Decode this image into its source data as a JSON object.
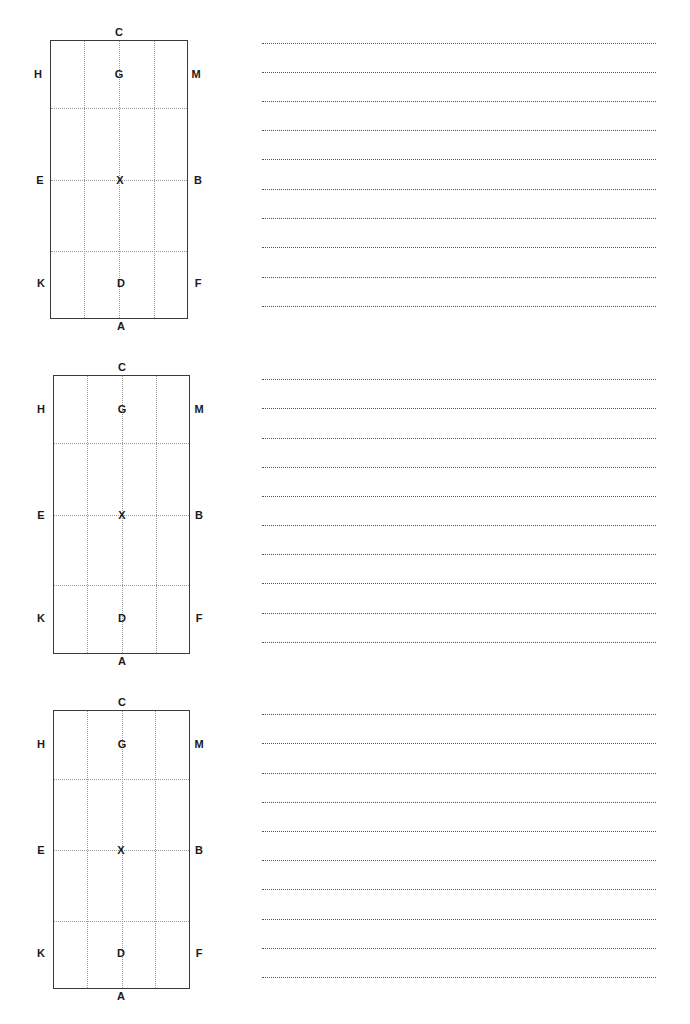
{
  "page": {
    "arenas": [
      {
        "markers": {
          "top": "C",
          "bottom": "A",
          "left_top": "H",
          "left_mid": "E",
          "left_bot": "K",
          "right_top": "M",
          "right_mid": "B",
          "right_bot": "F",
          "center_top": "G",
          "center_mid": "X",
          "center_bot": "D"
        },
        "writing_lines": 10
      },
      {
        "markers": {
          "top": "C",
          "bottom": "A",
          "left_top": "H",
          "left_mid": "E",
          "left_bot": "K",
          "right_top": "M",
          "right_mid": "B",
          "right_bot": "F",
          "center_top": "G",
          "center_mid": "X",
          "center_bot": "D"
        },
        "writing_lines": 10
      },
      {
        "markers": {
          "top": "C",
          "bottom": "A",
          "left_top": "H",
          "left_mid": "E",
          "left_bot": "K",
          "right_top": "M",
          "right_mid": "B",
          "right_bot": "F",
          "center_top": "G",
          "center_mid": "X",
          "center_bot": "D"
        },
        "writing_lines": 10
      }
    ],
    "colors": {
      "border": "#3a3a3a",
      "grid": "#9a9a9a",
      "writing_line": "#555555",
      "text": "#1a1a1a"
    }
  }
}
